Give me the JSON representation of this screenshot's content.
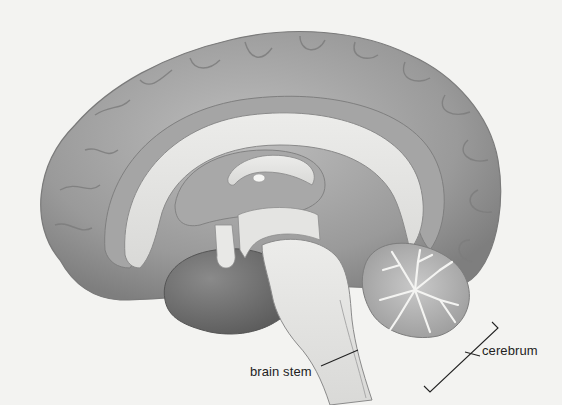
{
  "figure": {
    "labels": [
      {
        "id": "brain-stem",
        "text": "brain stem"
      },
      {
        "id": "cerebrum",
        "text": "cerebrum"
      }
    ]
  },
  "colors": {
    "background": "#f3f3f1",
    "cortex": "#9c9c9c",
    "cortex_light": "#b9b9b9",
    "white_matter": "#e6e6e4",
    "dark_lobe": "#6f6f6f",
    "line": "#222222"
  }
}
